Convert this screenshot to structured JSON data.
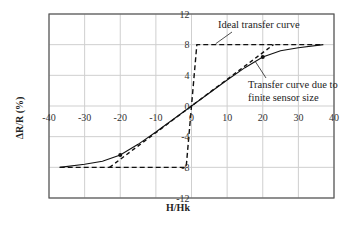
{
  "chart_data": {
    "type": "line",
    "title": "",
    "xlabel": "H/Hk",
    "ylabel": "ΔR/R (%)",
    "xlim": [
      -40,
      40
    ],
    "ylim": [
      -12,
      12
    ],
    "x_ticks": [
      "-40",
      "-30",
      "-20",
      "-10",
      "0",
      "10",
      "20",
      "30",
      "40"
    ],
    "y_ticks": [
      "12",
      "8",
      "4",
      "0",
      "-4",
      "-8",
      "-12"
    ],
    "grid": true,
    "legend": null,
    "series": [
      {
        "name": "Ideal transfer curve",
        "style": "dashed",
        "x": [
          -37,
          -1.5,
          1.5,
          37
        ],
        "y": [
          -8,
          -8,
          8,
          8
        ]
      },
      {
        "name": "Transfer curve due to finite sensor size",
        "style": "solid",
        "x": [
          -37,
          -30,
          -25,
          -20,
          -15,
          -10,
          -5,
          0,
          5,
          10,
          15,
          20,
          25,
          30,
          37
        ],
        "y": [
          -8,
          -7.6,
          -7.2,
          -6.4,
          -5.0,
          -3.4,
          -1.7,
          0,
          1.7,
          3.4,
          5.0,
          6.4,
          7.2,
          7.6,
          8
        ]
      },
      {
        "name": "Linear extension (dashed)",
        "style": "dashed",
        "x": [
          -23,
          23
        ],
        "y": [
          -8,
          8
        ]
      }
    ],
    "markers": [
      {
        "x": -20,
        "y": -6.4
      },
      {
        "x": 20,
        "y": 6.4
      }
    ],
    "annotations": [
      {
        "text": "Ideal transfer curve",
        "points_to": [
          4,
          8
        ]
      },
      {
        "text": "Transfer curve due to",
        "line2": "finite sensor size",
        "points_to": [
          18,
          6
        ]
      }
    ]
  }
}
